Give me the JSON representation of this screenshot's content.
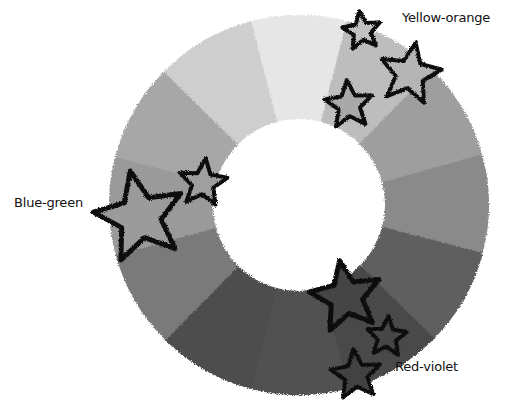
{
  "diagram": {
    "type": "color-wheel",
    "center": [
      299,
      205
    ],
    "outer_radius": 190,
    "inner_radius": 86,
    "segment_count": 12,
    "segments": [
      {
        "index": 0,
        "fill": "#e6e6e6"
      },
      {
        "index": 1,
        "fill": "#bdbdbd"
      },
      {
        "index": 2,
        "fill": "#9e9e9e"
      },
      {
        "index": 3,
        "fill": "#8a8a8a"
      },
      {
        "index": 4,
        "fill": "#5f5f5f"
      },
      {
        "index": 5,
        "fill": "#484848"
      },
      {
        "index": 6,
        "fill": "#515151"
      },
      {
        "index": 7,
        "fill": "#4e4e4e"
      },
      {
        "index": 8,
        "fill": "#7a7a7a"
      },
      {
        "index": 9,
        "fill": "#9a9a9a"
      },
      {
        "index": 10,
        "fill": "#a7a7a7"
      },
      {
        "index": 11,
        "fill": "#cecece"
      }
    ],
    "labels": [
      {
        "id": "yellow-orange",
        "text": "Yellow-orange",
        "x": 402,
        "y": 18
      },
      {
        "id": "blue-green",
        "text": "Blue-green",
        "x": 14,
        "y": 203
      },
      {
        "id": "red-violet",
        "text": "Red-violet",
        "x": 395,
        "y": 367
      }
    ],
    "stars": [
      {
        "group": "yellow-orange",
        "cx": 362,
        "cy": 31,
        "r": 20,
        "fill": "#c2c2c2"
      },
      {
        "group": "yellow-orange",
        "cx": 410,
        "cy": 74,
        "r": 32,
        "fill": "#b5b5b5"
      },
      {
        "group": "yellow-orange",
        "cx": 349,
        "cy": 105,
        "r": 25,
        "fill": "#a9a9a9"
      },
      {
        "group": "blue-green",
        "cx": 140,
        "cy": 217,
        "r": 47,
        "fill": "#9b9b9b"
      },
      {
        "group": "blue-green",
        "cx": 203,
        "cy": 183,
        "r": 25,
        "fill": "#9f9f9f"
      },
      {
        "group": "red-violet",
        "cx": 346,
        "cy": 297,
        "r": 37,
        "fill": "#444444"
      },
      {
        "group": "red-violet",
        "cx": 387,
        "cy": 337,
        "r": 21,
        "fill": "#474747"
      },
      {
        "group": "red-violet",
        "cx": 356,
        "cy": 375,
        "r": 26,
        "fill": "#434343"
      }
    ],
    "star_stroke": "#111111"
  }
}
